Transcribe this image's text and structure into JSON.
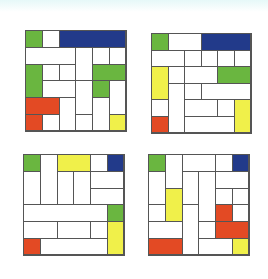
{
  "colors": {
    "white": "#ffffff",
    "green": "#6ab640",
    "blue": "#223a8a",
    "red": "#e34a24",
    "yellow": "#f0f04a",
    "border": "#555555"
  },
  "grids": [
    {
      "name": "puzzle-top-left",
      "left": 25,
      "top": 30,
      "cell": 16.8,
      "pieces": [
        {
          "c": 0,
          "r": 0,
          "w": 1,
          "h": 1,
          "color": "green"
        },
        {
          "c": 1,
          "r": 0,
          "w": 1,
          "h": 1,
          "color": "white"
        },
        {
          "c": 2,
          "r": 0,
          "w": 4,
          "h": 1,
          "color": "blue"
        },
        {
          "c": 0,
          "r": 1,
          "w": 3,
          "h": 1,
          "color": "white"
        },
        {
          "c": 3,
          "r": 1,
          "w": 1,
          "h": 2,
          "color": "white"
        },
        {
          "c": 2,
          "r": 2,
          "w": 1,
          "h": 1,
          "color": "white"
        },
        {
          "c": 4,
          "r": 1,
          "w": 1,
          "h": 1,
          "color": "white"
        },
        {
          "c": 5,
          "r": 1,
          "w": 1,
          "h": 1,
          "color": "white"
        },
        {
          "c": 0,
          "r": 2,
          "w": 1,
          "h": 2,
          "color": "green"
        },
        {
          "c": 1,
          "r": 2,
          "w": 1,
          "h": 1,
          "color": "white"
        },
        {
          "c": 4,
          "r": 2,
          "w": 2,
          "h": 1,
          "color": "green"
        },
        {
          "c": 4,
          "r": 3,
          "w": 1,
          "h": 1,
          "color": "green"
        },
        {
          "c": 1,
          "r": 3,
          "w": 2,
          "h": 1,
          "color": "white"
        },
        {
          "c": 2,
          "r": 4,
          "w": 1,
          "h": 2,
          "color": "white"
        },
        {
          "c": 3,
          "r": 3,
          "w": 1,
          "h": 2,
          "color": "white"
        },
        {
          "c": 5,
          "r": 3,
          "w": 1,
          "h": 2,
          "color": "white"
        },
        {
          "c": 0,
          "r": 4,
          "w": 2,
          "h": 1,
          "color": "red"
        },
        {
          "c": 0,
          "r": 5,
          "w": 1,
          "h": 1,
          "color": "red"
        },
        {
          "c": 4,
          "r": 4,
          "w": 1,
          "h": 2,
          "color": "white"
        },
        {
          "c": 1,
          "r": 5,
          "w": 1,
          "h": 1,
          "color": "white"
        },
        {
          "c": 3,
          "r": 5,
          "w": 1,
          "h": 1,
          "color": "white"
        },
        {
          "c": 5,
          "r": 5,
          "w": 1,
          "h": 1,
          "color": "yellow"
        }
      ]
    },
    {
      "name": "puzzle-top-right",
      "left": 151,
      "top": 33,
      "cell": 16.6,
      "pieces": [
        {
          "c": 0,
          "r": 0,
          "w": 1,
          "h": 1,
          "color": "green"
        },
        {
          "c": 1,
          "r": 0,
          "w": 2,
          "h": 1,
          "color": "white"
        },
        {
          "c": 2,
          "r": 1,
          "w": 1,
          "h": 1,
          "color": "white"
        },
        {
          "c": 3,
          "r": 0,
          "w": 3,
          "h": 1,
          "color": "blue"
        },
        {
          "c": 0,
          "r": 1,
          "w": 2,
          "h": 1,
          "color": "white"
        },
        {
          "c": 1,
          "r": 2,
          "w": 1,
          "h": 1,
          "color": "white"
        },
        {
          "c": 3,
          "r": 1,
          "w": 1,
          "h": 1,
          "color": "white"
        },
        {
          "c": 2,
          "r": 2,
          "w": 2,
          "h": 1,
          "color": "white"
        },
        {
          "c": 4,
          "r": 1,
          "w": 1,
          "h": 1,
          "color": "white"
        },
        {
          "c": 5,
          "r": 1,
          "w": 1,
          "h": 1,
          "color": "white"
        },
        {
          "c": 0,
          "r": 2,
          "w": 1,
          "h": 2,
          "color": "yellow"
        },
        {
          "c": 4,
          "r": 2,
          "w": 2,
          "h": 1,
          "color": "green"
        },
        {
          "c": 1,
          "r": 3,
          "w": 1,
          "h": 3,
          "color": "white"
        },
        {
          "c": 2,
          "r": 3,
          "w": 1,
          "h": 1,
          "color": "white"
        },
        {
          "c": 3,
          "r": 3,
          "w": 3,
          "h": 1,
          "color": "white"
        },
        {
          "c": 0,
          "r": 4,
          "w": 1,
          "h": 1,
          "color": "white"
        },
        {
          "c": 2,
          "r": 4,
          "w": 2,
          "h": 1,
          "color": "white"
        },
        {
          "c": 4,
          "r": 4,
          "w": 1,
          "h": 1,
          "color": "white"
        },
        {
          "c": 5,
          "r": 4,
          "w": 1,
          "h": 2,
          "color": "yellow"
        },
        {
          "c": 0,
          "r": 5,
          "w": 1,
          "h": 1,
          "color": "red"
        },
        {
          "c": 2,
          "r": 5,
          "w": 3,
          "h": 1,
          "color": "white"
        }
      ]
    },
    {
      "name": "puzzle-bottom-left",
      "left": 23,
      "top": 154,
      "cell": 16.8,
      "pieces": [
        {
          "c": 0,
          "r": 0,
          "w": 1,
          "h": 1,
          "color": "green"
        },
        {
          "c": 1,
          "r": 0,
          "w": 1,
          "h": 3,
          "color": "white"
        },
        {
          "c": 2,
          "r": 0,
          "w": 2,
          "h": 1,
          "color": "yellow"
        },
        {
          "c": 4,
          "r": 0,
          "w": 1,
          "h": 1,
          "color": "white"
        },
        {
          "c": 5,
          "r": 0,
          "w": 1,
          "h": 1,
          "color": "blue"
        },
        {
          "c": 0,
          "r": 1,
          "w": 1,
          "h": 2,
          "color": "white"
        },
        {
          "c": 2,
          "r": 1,
          "w": 1,
          "h": 2,
          "color": "white"
        },
        {
          "c": 3,
          "r": 1,
          "w": 1,
          "h": 2,
          "color": "white"
        },
        {
          "c": 4,
          "r": 1,
          "w": 2,
          "h": 1,
          "color": "white"
        },
        {
          "c": 4,
          "r": 2,
          "w": 2,
          "h": 1,
          "color": "white"
        },
        {
          "c": 0,
          "r": 3,
          "w": 5,
          "h": 1,
          "color": "white"
        },
        {
          "c": 4,
          "r": 4,
          "w": 1,
          "h": 1,
          "color": "white"
        },
        {
          "c": 5,
          "r": 3,
          "w": 1,
          "h": 1,
          "color": "green"
        },
        {
          "c": 0,
          "r": 4,
          "w": 2,
          "h": 1,
          "color": "white"
        },
        {
          "c": 2,
          "r": 4,
          "w": 2,
          "h": 1,
          "color": "white"
        },
        {
          "c": 5,
          "r": 4,
          "w": 1,
          "h": 2,
          "color": "yellow"
        },
        {
          "c": 0,
          "r": 5,
          "w": 1,
          "h": 1,
          "color": "red"
        },
        {
          "c": 1,
          "r": 5,
          "w": 4,
          "h": 1,
          "color": "white"
        }
      ]
    },
    {
      "name": "puzzle-bottom-right",
      "left": 148,
      "top": 154,
      "cell": 16.8,
      "pieces": [
        {
          "c": 0,
          "r": 0,
          "w": 1,
          "h": 1,
          "color": "green"
        },
        {
          "c": 1,
          "r": 0,
          "w": 1,
          "h": 2,
          "color": "white"
        },
        {
          "c": 2,
          "r": 0,
          "w": 2,
          "h": 1,
          "color": "white"
        },
        {
          "c": 3,
          "r": 1,
          "w": 1,
          "h": 3,
          "color": "white"
        },
        {
          "c": 4,
          "r": 0,
          "w": 1,
          "h": 1,
          "color": "white"
        },
        {
          "c": 5,
          "r": 0,
          "w": 1,
          "h": 1,
          "color": "blue"
        },
        {
          "c": 0,
          "r": 1,
          "w": 1,
          "h": 2,
          "color": "white"
        },
        {
          "c": 2,
          "r": 1,
          "w": 1,
          "h": 2,
          "color": "white"
        },
        {
          "c": 4,
          "r": 1,
          "w": 2,
          "h": 1,
          "color": "white"
        },
        {
          "c": 5,
          "r": 2,
          "w": 1,
          "h": 1,
          "color": "white"
        },
        {
          "c": 1,
          "r": 2,
          "w": 1,
          "h": 2,
          "color": "yellow"
        },
        {
          "c": 4,
          "r": 2,
          "w": 1,
          "h": 1,
          "color": "white"
        },
        {
          "c": 0,
          "r": 3,
          "w": 1,
          "h": 1,
          "color": "white"
        },
        {
          "c": 2,
          "r": 3,
          "w": 1,
          "h": 3,
          "color": "white"
        },
        {
          "c": 4,
          "r": 3,
          "w": 1,
          "h": 1,
          "color": "red"
        },
        {
          "c": 4,
          "r": 4,
          "w": 2,
          "h": 1,
          "color": "red"
        },
        {
          "c": 5,
          "r": 3,
          "w": 1,
          "h": 1,
          "color": "white"
        },
        {
          "c": 0,
          "r": 4,
          "w": 2,
          "h": 1,
          "color": "white"
        },
        {
          "c": 3,
          "r": 4,
          "w": 1,
          "h": 1,
          "color": "white"
        },
        {
          "c": 0,
          "r": 5,
          "w": 2,
          "h": 1,
          "color": "red"
        },
        {
          "c": 3,
          "r": 5,
          "w": 2,
          "h": 1,
          "color": "white"
        },
        {
          "c": 5,
          "r": 5,
          "w": 1,
          "h": 1,
          "color": "yellow"
        }
      ]
    }
  ]
}
